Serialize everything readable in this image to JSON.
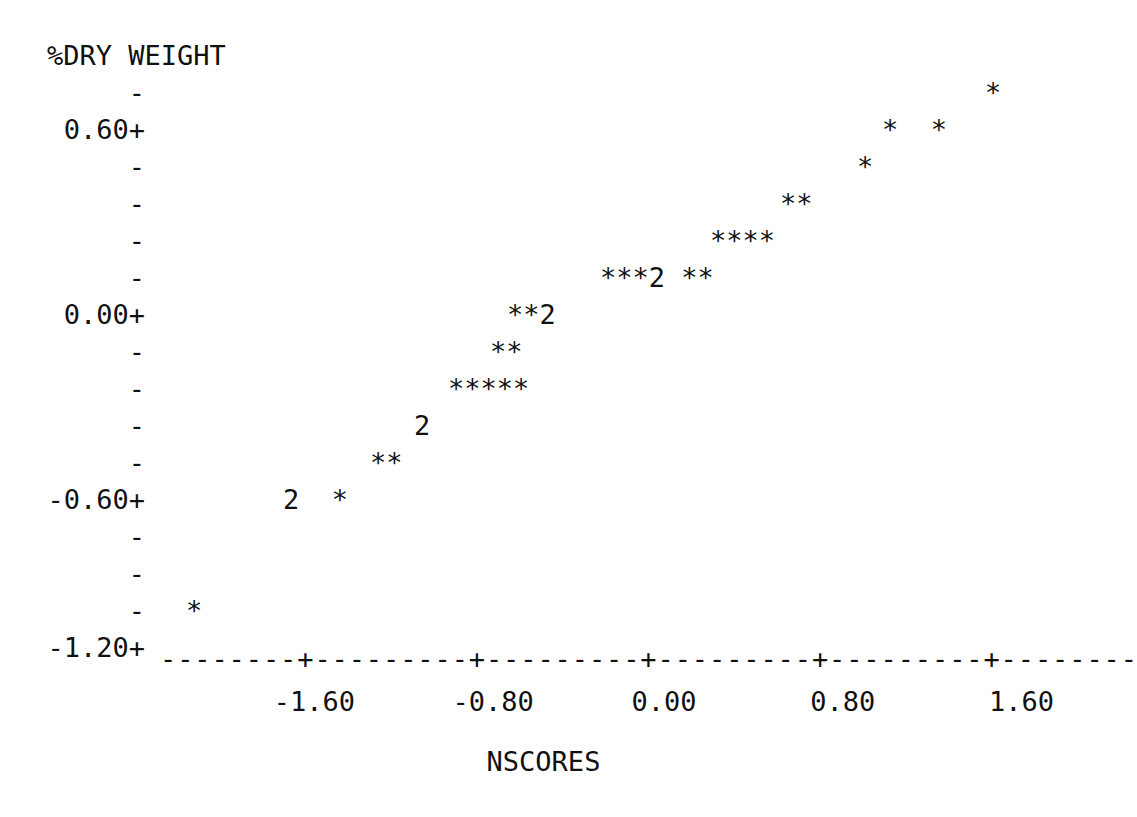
{
  "chart_data": {
    "type": "scatter",
    "title": "",
    "subtitle": "",
    "ylabel": "%DRY WEIGHT",
    "xlabel": "NSCORES",
    "grid": false,
    "legend": null,
    "style": "ascii-character-plot",
    "marker_symbol": "*",
    "overlap_symbol_note": "A digit such as 2 marks that many points sharing one character cell",
    "xlim": [
      -2.0,
      2.0
    ],
    "ylim": [
      -1.35,
      0.82
    ],
    "xticks": [
      -1.6,
      -0.8,
      0.0,
      0.8,
      1.6
    ],
    "xtick_labels": [
      "-1.60",
      "-0.80",
      "0.00",
      "0.80",
      "1.60"
    ],
    "yticks": [
      0.6,
      0.0,
      -0.6,
      -1.2
    ],
    "ytick_labels": [
      "0.60+",
      "0.00+",
      "-0.60+",
      "-1.20+"
    ],
    "axis_tick_char": "+",
    "axis_minor_char": "-",
    "axis_line": "--------+---------+---------+---------+---------+--------",
    "rows": [
      {
        "y": 0.74,
        "cells": "*",
        "x_start": 1.72
      },
      {
        "y": 0.6,
        "cells": "*  *",
        "x_start": 1.44
      },
      {
        "y": 0.49,
        "cells": "*",
        "x_start": 1.28
      },
      {
        "y": 0.38,
        "cells": "**",
        "x_start": 1.08
      },
      {
        "y": 0.27,
        "cells": "****",
        "x_start": 0.8
      },
      {
        "y": 0.16,
        "cells": "***2 **",
        "x_start": 0.34
      },
      {
        "y": 0.05,
        "cells": "**2",
        "x_start": 0.1
      },
      {
        "y": -0.09,
        "cells": "**",
        "x_start": -0.15
      },
      {
        "y": -0.2,
        "cells": "*****",
        "x_start": -0.5
      },
      {
        "y": -0.31,
        "cells": "2",
        "x_start": -0.73
      },
      {
        "y": -0.46,
        "cells": "**",
        "x_start": -1.08
      },
      {
        "y": -0.6,
        "cells": "2  *",
        "x_start": -1.4
      },
      {
        "y": -1.09,
        "cells": "*",
        "x_start": -1.8
      }
    ],
    "points": [
      {
        "x": -1.8,
        "y": -1.09,
        "count": 1
      },
      {
        "x": -1.4,
        "y": -0.6,
        "count": 2
      },
      {
        "x": -1.21,
        "y": -0.6,
        "count": 1
      },
      {
        "x": -1.08,
        "y": -0.46,
        "count": 1
      },
      {
        "x": -1.0,
        "y": -0.46,
        "count": 1
      },
      {
        "x": -0.73,
        "y": -0.31,
        "count": 2
      },
      {
        "x": -0.5,
        "y": -0.2,
        "count": 1
      },
      {
        "x": -0.42,
        "y": -0.2,
        "count": 1
      },
      {
        "x": -0.34,
        "y": -0.2,
        "count": 1
      },
      {
        "x": -0.26,
        "y": -0.2,
        "count": 1
      },
      {
        "x": -0.18,
        "y": -0.2,
        "count": 1
      },
      {
        "x": -0.15,
        "y": -0.09,
        "count": 1
      },
      {
        "x": -0.07,
        "y": -0.09,
        "count": 1
      },
      {
        "x": 0.1,
        "y": 0.05,
        "count": 1
      },
      {
        "x": 0.18,
        "y": 0.05,
        "count": 1
      },
      {
        "x": 0.26,
        "y": 0.05,
        "count": 2
      },
      {
        "x": 0.34,
        "y": 0.16,
        "count": 1
      },
      {
        "x": 0.42,
        "y": 0.16,
        "count": 1
      },
      {
        "x": 0.5,
        "y": 0.16,
        "count": 1
      },
      {
        "x": 0.58,
        "y": 0.16,
        "count": 2
      },
      {
        "x": 0.74,
        "y": 0.16,
        "count": 1
      },
      {
        "x": 0.82,
        "y": 0.16,
        "count": 1
      },
      {
        "x": 0.8,
        "y": 0.27,
        "count": 1
      },
      {
        "x": 0.88,
        "y": 0.27,
        "count": 1
      },
      {
        "x": 0.96,
        "y": 0.27,
        "count": 1
      },
      {
        "x": 1.04,
        "y": 0.27,
        "count": 1
      },
      {
        "x": 1.08,
        "y": 0.38,
        "count": 1
      },
      {
        "x": 1.16,
        "y": 0.38,
        "count": 1
      },
      {
        "x": 1.28,
        "y": 0.49,
        "count": 1
      },
      {
        "x": 1.44,
        "y": 0.6,
        "count": 1
      },
      {
        "x": 1.6,
        "y": 0.6,
        "count": 1
      },
      {
        "x": 1.72,
        "y": 0.74,
        "count": 1
      }
    ]
  },
  "axes": {
    "y_label_text": "%DRY WEIGHT",
    "x_label_text": "NSCORES",
    "y_rows": [
      {
        "kind": "dash",
        "text": "-",
        "top": 79
      },
      {
        "kind": "tick",
        "text": "0.60+",
        "top": 116
      },
      {
        "kind": "dash",
        "text": "-",
        "top": 153
      },
      {
        "kind": "dash",
        "text": "-",
        "top": 190
      },
      {
        "kind": "dash",
        "text": "-",
        "top": 227
      },
      {
        "kind": "dash",
        "text": "-",
        "top": 264
      },
      {
        "kind": "tick",
        "text": "0.00+",
        "top": 301
      },
      {
        "kind": "dash",
        "text": "-",
        "top": 338
      },
      {
        "kind": "dash",
        "text": "-",
        "top": 375
      },
      {
        "kind": "dash",
        "text": "-",
        "top": 412
      },
      {
        "kind": "dash",
        "text": "-",
        "top": 449
      },
      {
        "kind": "tick",
        "text": "-0.60+",
        "top": 486
      },
      {
        "kind": "dash",
        "text": "-",
        "top": 523
      },
      {
        "kind": "dash",
        "text": "-",
        "top": 560
      },
      {
        "kind": "dash",
        "text": "-",
        "top": 597
      },
      {
        "kind": "tick",
        "text": "-1.20+",
        "top": 634
      }
    ],
    "x_axis_line": "--------+---------+---------+---------+---------+--------",
    "x_tick_label_line": "       -1.60      -0.80      0.00       0.80       1.60"
  },
  "data_rows": [
    {
      "text": "*",
      "left": 985,
      "top": 79
    },
    {
      "text": "*  *",
      "left": 882,
      "top": 116
    },
    {
      "text": "*",
      "left": 857,
      "top": 153
    },
    {
      "text": "**",
      "left": 780,
      "top": 190
    },
    {
      "text": "****",
      "left": 710,
      "top": 227
    },
    {
      "text": "***2 **",
      "left": 600,
      "top": 264
    },
    {
      "text": "**2",
      "left": 507,
      "top": 301
    },
    {
      "text": "**",
      "left": 490,
      "top": 338
    },
    {
      "text": "*****",
      "left": 448,
      "top": 375
    },
    {
      "text": "2",
      "left": 414,
      "top": 412
    },
    {
      "text": "**",
      "left": 370,
      "top": 449
    },
    {
      "text": "2  *",
      "left": 283,
      "top": 486
    },
    {
      "text": "*",
      "left": 186,
      "top": 597
    }
  ]
}
